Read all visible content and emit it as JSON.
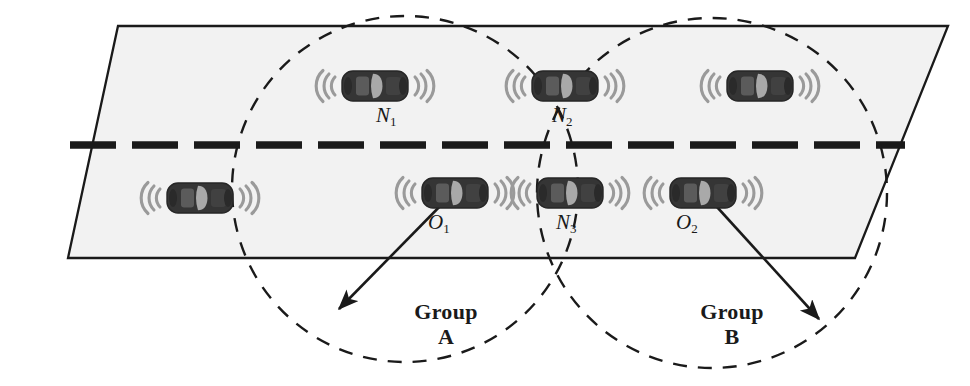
{
  "diagram": {
    "road": {
      "name": "road-surface",
      "fill": "#f2f2f2",
      "stroke": "#1a1a1a",
      "lane_divider_color": "#1a1a1a",
      "lane_divider_dashes": 13
    },
    "colors": {
      "car_body": "#3a3a3a",
      "car_body_dark": "#2b2b2b",
      "car_window": "#a8a8a8",
      "signal_arc": "#9a9a9a",
      "circle_dash": "#1a1a1a",
      "arrow": "#1a1a1a",
      "text": "#1a1a1a",
      "road_fill": "#f2f2f2"
    },
    "groups": [
      {
        "id": "group-a",
        "label_line1": "Group",
        "label_line2": "A",
        "cx": 405,
        "cy": 189,
        "r": 173
      },
      {
        "id": "group-b",
        "label_line1": "Group",
        "label_line2": "B",
        "cx": 712,
        "cy": 193,
        "r": 175
      }
    ],
    "vehicles": [
      {
        "id": "vehicle-n1",
        "label": "N",
        "sub": "1",
        "x": 375,
        "y": 86,
        "labeled": true
      },
      {
        "id": "vehicle-n2",
        "label": "N",
        "sub": "2",
        "x": 565,
        "y": 86,
        "labeled": true
      },
      {
        "id": "vehicle-top-right",
        "label": "",
        "sub": "",
        "x": 760,
        "y": 86,
        "labeled": false
      },
      {
        "id": "vehicle-bottom-left",
        "label": "",
        "sub": "",
        "x": 200,
        "y": 198,
        "labeled": false
      },
      {
        "id": "vehicle-o1",
        "label": "O",
        "sub": "1",
        "x": 455,
        "y": 193,
        "labeled": true
      },
      {
        "id": "vehicle-n3",
        "label": "N",
        "sub": "3",
        "x": 570,
        "y": 193,
        "labeled": true
      },
      {
        "id": "vehicle-o2",
        "label": "O",
        "sub": "2",
        "x": 703,
        "y": 193,
        "labeled": true
      }
    ],
    "arrows": [
      {
        "id": "radius-arrow-a",
        "from_x": 450,
        "from_y": 196,
        "to_x": 336,
        "to_y": 312
      },
      {
        "id": "radius-arrow-b",
        "from_x": 707,
        "from_y": 196,
        "to_x": 822,
        "to_y": 322
      }
    ]
  }
}
